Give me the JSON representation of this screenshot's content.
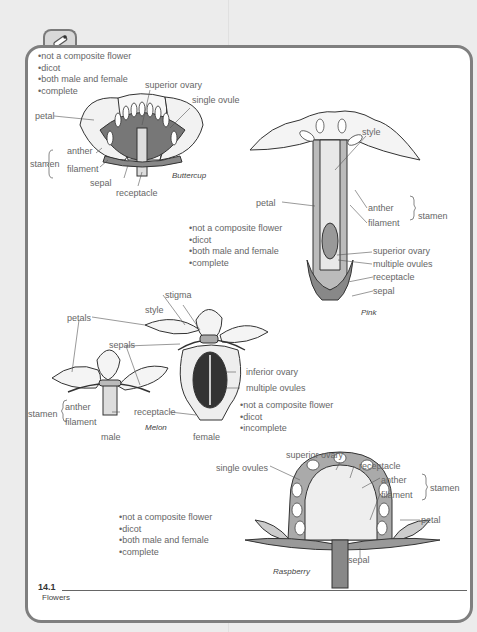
{
  "page": {
    "section_number": "14.1",
    "section_title": "Flowers",
    "tab_icon": "pencil-icon"
  },
  "buttercup": {
    "caption": "Buttercup",
    "traits": [
      "not a composite flower",
      "dicot",
      "both male and female",
      "complete"
    ],
    "labels": {
      "superior_ovary": "superior ovary",
      "single_ovule": "single ovule",
      "petal": "petal",
      "stamen": "stamen",
      "anther": "anther",
      "filament": "filament",
      "sepal": "sepal",
      "receptacle": "receptacle"
    }
  },
  "pink": {
    "caption": "Pink",
    "traits": [
      "not a composite flower",
      "dicot",
      "both male and female",
      "complete"
    ],
    "labels": {
      "style": "style",
      "petal": "petal",
      "anther": "anther",
      "filament": "filament",
      "stamen": "stamen",
      "superior_ovary": "superior ovary",
      "multiple_ovules": "multiple ovules",
      "receptacle": "receptacle",
      "sepal": "sepal"
    }
  },
  "melon": {
    "caption": "Melon",
    "male_label": "male",
    "female_label": "female",
    "traits": [
      "not a composite flower",
      "dicot",
      "incomplete"
    ],
    "labels": {
      "stigma": "stigma",
      "style": "style",
      "petals": "petals",
      "sepals": "sepals",
      "stamen": "stamen",
      "anther": "anther",
      "filament": "filament",
      "receptacle": "receptacle",
      "inferior_ovary": "inferior ovary",
      "multiple_ovules": "multiple ovules"
    }
  },
  "raspberry": {
    "caption": "Raspberry",
    "traits": [
      "not a composite flower",
      "dicot",
      "both male and female",
      "complete"
    ],
    "labels": {
      "superior_ovary": "superior ovary",
      "single_ovules": "single ovules",
      "receptacle": "receptacle",
      "anther": "anther",
      "filament": "filament",
      "stamen": "stamen",
      "petal": "petal",
      "sepal": "sepal"
    }
  }
}
